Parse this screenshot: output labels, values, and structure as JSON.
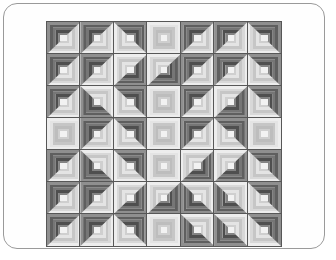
{
  "frame": {
    "border_color": "#9a9a9a",
    "background": "#fefefe",
    "corner_radius": "14px"
  },
  "quilt": {
    "rows": 7,
    "cols": 7,
    "x": 43,
    "y": 18,
    "width": 234,
    "height": 224,
    "sash_color": "#6e6e6e",
    "block_border_color": "#575757",
    "ring_count": 6,
    "center_color": "#f2f2f2",
    "light_ramp": [
      "#ededed",
      "#d8d8d8",
      "#c6c6c6",
      "#e4e4e4",
      "#cfcfcf",
      "#bdbdbd"
    ],
    "dark_ramp": [
      "#8f8f8f",
      "#5f5f5f",
      "#767676",
      "#4f4f4f",
      "#848484",
      "#5a5a5a"
    ],
    "orientation_legend": {
      "tl": "dark wedge in top-left corner",
      "tr": "dark wedge in top-right corner",
      "br": "dark wedge in bottom-right corner",
      "bl": "dark wedge in bottom-left corner",
      "light": "all-light block (diamond point)",
      "dark": "all-dark block (corner field)"
    },
    "orientations": [
      [
        "tl",
        "tl",
        "tr",
        "light",
        "tl",
        "tl",
        "tr"
      ],
      [
        "tl",
        "tl",
        "br",
        "br",
        "tl",
        "tl",
        "tr"
      ],
      [
        "tl",
        "bl",
        "tr",
        "light",
        "tl",
        "br",
        "tr"
      ],
      [
        "light",
        "tl",
        "tr",
        "light",
        "tl",
        "tr",
        "light"
      ],
      [
        "tl",
        "bl",
        "tr",
        "light",
        "br",
        "br",
        "tr"
      ],
      [
        "tl",
        "tl",
        "br",
        "br",
        "bl",
        "bl",
        "tr"
      ],
      [
        "tl",
        "tl",
        "tr",
        "light",
        "bl",
        "bl",
        "tr"
      ]
    ]
  }
}
